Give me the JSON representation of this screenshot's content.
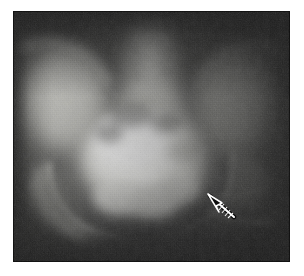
{
  "figure": {
    "kind": "medical-radiograph",
    "modality": "X-ray",
    "view": "anteroposterior pelvis",
    "caption": "",
    "background_color": "#ffffff",
    "plate": {
      "left": 13,
      "top": 11,
      "width": 277,
      "height": 251,
      "base_color": "#3a3a3a",
      "darkest": "#1e1e1e",
      "brightest": "#f2f2f0"
    },
    "annotations": [
      {
        "type": "arrow",
        "name": "finding-arrow",
        "color": "#ffffff",
        "outline_color": "#000000",
        "tip_x": 210,
        "tip_y": 196,
        "tail_x": 234,
        "tail_y": 217,
        "label": ""
      }
    ],
    "regions": [
      {
        "name": "contrast-filled-bladder",
        "cx": 143,
        "cy": 160,
        "rx": 62,
        "ry": 52,
        "tone": "#eeeeec"
      },
      {
        "name": "sacrum-lumbar-spine",
        "cx": 150,
        "cy": 62,
        "rx": 30,
        "ry": 52,
        "tone": "#c9c9c5"
      },
      {
        "name": "left-iliac-wing",
        "cx": 60,
        "cy": 96,
        "rx": 44,
        "ry": 54,
        "tone": "#b4b4b0"
      },
      {
        "name": "right-iliac-wing",
        "cx": 228,
        "cy": 96,
        "rx": 44,
        "ry": 54,
        "tone": "#9c9c98"
      },
      {
        "name": "left-acetabulum",
        "cx": 72,
        "cy": 196,
        "rx": 44,
        "ry": 36,
        "tone": "#8e8e8a"
      },
      {
        "name": "right-acetabulum",
        "cx": 216,
        "cy": 190,
        "rx": 42,
        "ry": 34,
        "tone": "#868682"
      },
      {
        "name": "pubic-symphysis-shadow",
        "cx": 146,
        "cy": 234,
        "rx": 58,
        "ry": 22,
        "tone": "#4a4a48"
      },
      {
        "name": "soft-tissue-background",
        "cx": 152,
        "cy": 136,
        "rx": 140,
        "ry": 128,
        "tone": "#3d3d3b"
      }
    ]
  }
}
